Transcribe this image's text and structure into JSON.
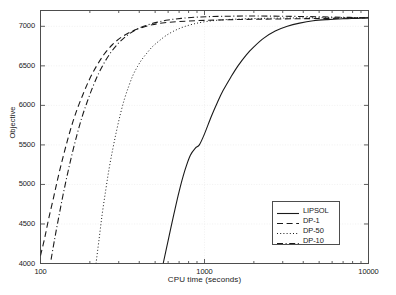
{
  "chart_data": {
    "type": "line",
    "title": "",
    "xlabel": "CPU time (seconds)",
    "ylabel": "Objective",
    "xscale": "log",
    "yscale": "linear",
    "xlim": [
      100,
      10000
    ],
    "ylim": [
      4000,
      7200
    ],
    "xticks": [
      100,
      1000,
      10000
    ],
    "xtick_labels": [
      "100",
      "1000",
      "10000"
    ],
    "yticks": [
      4000,
      4500,
      5000,
      5500,
      6000,
      6500,
      7000
    ],
    "ytick_labels": [
      "4000",
      "4500",
      "5000",
      "5500",
      "6000",
      "6500",
      "7000"
    ],
    "grid": true,
    "legend_position": "lower right",
    "series": [
      {
        "name": "LIPSOL",
        "style": "solid",
        "color": "#1a1a1a",
        "points": [
          [
            560,
            4000
          ],
          [
            600,
            4290
          ],
          [
            650,
            4620
          ],
          [
            700,
            4910
          ],
          [
            760,
            5180
          ],
          [
            820,
            5370
          ],
          [
            880,
            5460
          ],
          [
            930,
            5500
          ],
          [
            1000,
            5640
          ],
          [
            1100,
            5860
          ],
          [
            1200,
            6040
          ],
          [
            1300,
            6190
          ],
          [
            1450,
            6360
          ],
          [
            1600,
            6500
          ],
          [
            1800,
            6640
          ],
          [
            2000,
            6740
          ],
          [
            2300,
            6850
          ],
          [
            2700,
            6940
          ],
          [
            3200,
            7000
          ],
          [
            3800,
            7040
          ],
          [
            4600,
            7070
          ],
          [
            5600,
            7085
          ],
          [
            7000,
            7095
          ],
          [
            8500,
            7100
          ],
          [
            10000,
            7105
          ]
        ]
      },
      {
        "name": "DP-1",
        "style": "dashed",
        "color": "#1a1a1a",
        "points": [
          [
            100,
            4100
          ],
          [
            106,
            4320
          ],
          [
            112,
            4560
          ],
          [
            120,
            4830
          ],
          [
            128,
            5090
          ],
          [
            137,
            5340
          ],
          [
            147,
            5580
          ],
          [
            158,
            5800
          ],
          [
            170,
            5990
          ],
          [
            185,
            6180
          ],
          [
            200,
            6340
          ],
          [
            220,
            6500
          ],
          [
            245,
            6650
          ],
          [
            275,
            6770
          ],
          [
            310,
            6860
          ],
          [
            355,
            6930
          ],
          [
            410,
            6980
          ],
          [
            480,
            7020
          ],
          [
            570,
            7045
          ],
          [
            700,
            7060
          ],
          [
            900,
            7072
          ],
          [
            1200,
            7080
          ],
          [
            1700,
            7087
          ],
          [
            2600,
            7092
          ],
          [
            4200,
            7097
          ],
          [
            7000,
            7102
          ],
          [
            10000,
            7108
          ]
        ]
      },
      {
        "name": "DP-50",
        "style": "dotted",
        "color": "#1a1a1a",
        "points": [
          [
            218,
            4000
          ],
          [
            228,
            4320
          ],
          [
            238,
            4630
          ],
          [
            250,
            4930
          ],
          [
            262,
            5200
          ],
          [
            276,
            5450
          ],
          [
            291,
            5680
          ],
          [
            307,
            5890
          ],
          [
            325,
            6080
          ],
          [
            345,
            6240
          ],
          [
            366,
            6380
          ],
          [
            390,
            6490
          ],
          [
            415,
            6580
          ],
          [
            445,
            6660
          ],
          [
            480,
            6740
          ],
          [
            525,
            6810
          ],
          [
            580,
            6880
          ],
          [
            650,
            6940
          ],
          [
            740,
            6990
          ],
          [
            860,
            7030
          ],
          [
            1020,
            7060
          ],
          [
            1250,
            7080
          ],
          [
            1600,
            7092
          ],
          [
            2200,
            7100
          ],
          [
            3200,
            7105
          ],
          [
            5000,
            7108
          ],
          [
            10000,
            7112
          ]
        ]
      },
      {
        "name": "DP-10",
        "style": "dashdot",
        "color": "#1a1a1a",
        "points": [
          [
            116,
            4050
          ],
          [
            122,
            4310
          ],
          [
            129,
            4580
          ],
          [
            137,
            4860
          ],
          [
            146,
            5130
          ],
          [
            156,
            5390
          ],
          [
            167,
            5630
          ],
          [
            179,
            5850
          ],
          [
            193,
            6050
          ],
          [
            209,
            6240
          ],
          [
            227,
            6410
          ],
          [
            248,
            6560
          ],
          [
            273,
            6690
          ],
          [
            303,
            6800
          ],
          [
            340,
            6890
          ],
          [
            385,
            6960
          ],
          [
            440,
            7010
          ],
          [
            510,
            7050
          ],
          [
            600,
            7080
          ],
          [
            720,
            7100
          ],
          [
            880,
            7115
          ],
          [
            1100,
            7123
          ],
          [
            1450,
            7128
          ],
          [
            2000,
            7130
          ],
          [
            2900,
            7128
          ],
          [
            4400,
            7122
          ],
          [
            6800,
            7115
          ],
          [
            10000,
            7108
          ]
        ]
      }
    ]
  },
  "legend": {
    "items": [
      {
        "label": "LIPSOL",
        "style": "solid"
      },
      {
        "label": "DP-1",
        "style": "dashed"
      },
      {
        "label": "DP-50",
        "style": "dotted"
      },
      {
        "label": "DP-10",
        "style": "dashdot"
      }
    ]
  },
  "colors": {
    "axis": "#4d4d4d",
    "grid": "#ededed",
    "line": "#1a1a1a",
    "background": "#ffffff"
  }
}
